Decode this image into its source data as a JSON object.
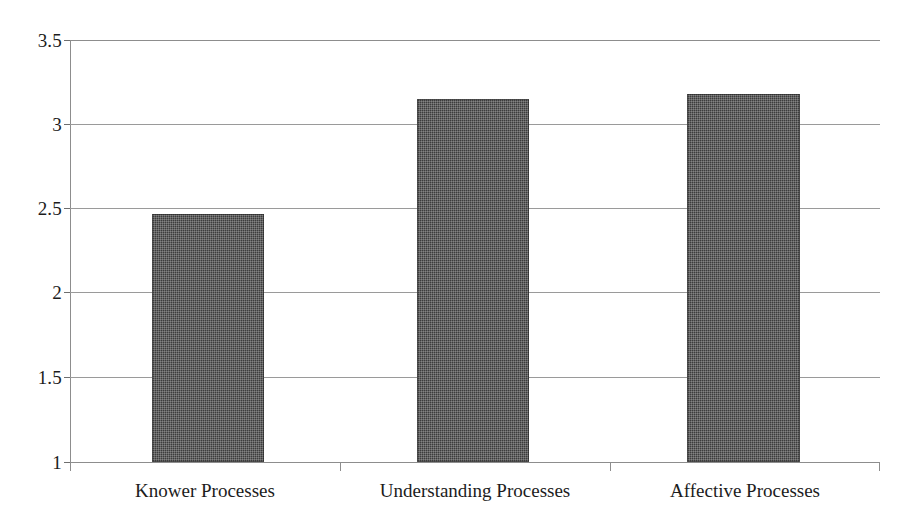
{
  "chart_data": {
    "type": "bar",
    "title": "",
    "subtitle": "",
    "xlabel": "",
    "ylabel": "",
    "categories": [
      "Knower Processes",
      "Understanding Processes",
      "Affective Processes"
    ],
    "values": [
      2.47,
      3.15,
      3.18
    ],
    "ylim": [
      1,
      3.5
    ],
    "ytick_labels": [
      "3.5",
      "3",
      "2.5",
      "2",
      "1.5",
      "1"
    ],
    "ytick_values": [
      3.5,
      3,
      2.5,
      2,
      1.5,
      1
    ],
    "grid": true,
    "legend": false,
    "series": [
      {
        "name": "",
        "values": [
          2.47,
          3.15,
          3.18
        ]
      }
    ],
    "colors": {
      "bar_fill": "#3c3c3c",
      "gridline": "#9a9a9a",
      "axis": "#8d8d8d",
      "text": "#1c1c1c",
      "background": "#ffffff"
    }
  }
}
